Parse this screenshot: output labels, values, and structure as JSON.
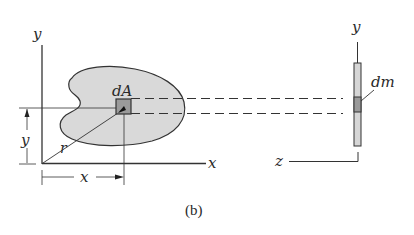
{
  "figure": {
    "caption": "(b)",
    "left_view": {
      "axis_y_label": "y",
      "axis_x_label": "x",
      "element_label": "dA",
      "radius_label": "r",
      "dim_y_label": "y",
      "dim_x_label": "x"
    },
    "right_view": {
      "axis_y_label": "y",
      "axis_z_label": "z",
      "element_label": "dm"
    },
    "colors": {
      "line": "#333333",
      "region_fill": "#d9d9d9",
      "element_fill": "#9a9a9a",
      "background": "#ffffff"
    }
  }
}
